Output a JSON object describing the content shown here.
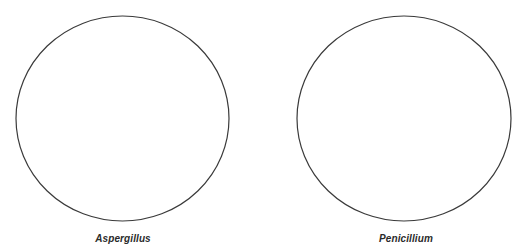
{
  "diagram": {
    "type": "venn-style-panels",
    "stroke_color": "#3a3a3a",
    "background": "#ffffff",
    "panels": [
      {
        "id": "aspergillus",
        "label": "Aspergillus",
        "shape": "ellipse",
        "cx": 122.5,
        "cy": 118.5,
        "rx": 106.5,
        "ry": 102.5
      },
      {
        "id": "penicillium",
        "label": "Penicillium",
        "shape": "ellipse",
        "cx": 404,
        "cy": 118.5,
        "rx": 107,
        "ry": 102.5
      }
    ]
  }
}
